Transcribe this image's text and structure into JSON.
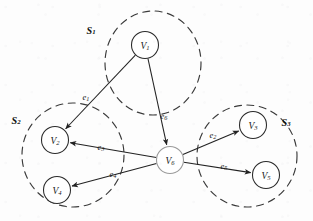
{
  "figure": {
    "kind": "graph-partition-diagram",
    "width": 313,
    "height": 221,
    "background_color": "#fdfdfd",
    "ink_color": "#222222",
    "hub_stroke_color": "#9a9a9a"
  },
  "nodes": [
    {
      "id": "v1",
      "base": "V",
      "sub": "1",
      "cx": 145,
      "cy": 45,
      "r": 13.5,
      "hub": false
    },
    {
      "id": "v2",
      "base": "V",
      "sub": "2",
      "cx": 55,
      "cy": 140,
      "r": 13.5,
      "hub": false
    },
    {
      "id": "v3",
      "base": "V",
      "sub": "3",
      "cx": 253,
      "cy": 125,
      "r": 13.5,
      "hub": false
    },
    {
      "id": "v4",
      "base": "V",
      "sub": "4",
      "cx": 57,
      "cy": 190,
      "r": 13.5,
      "hub": false
    },
    {
      "id": "v5",
      "base": "V",
      "sub": "5",
      "cx": 266,
      "cy": 175,
      "r": 13.5,
      "hub": false
    },
    {
      "id": "v6",
      "base": "V",
      "sub": "6",
      "cx": 170,
      "cy": 160,
      "r": 13.5,
      "hub": true
    }
  ],
  "edges": [
    {
      "id": "e1",
      "base": "e",
      "sub": "1",
      "from": "v1",
      "to": "v2",
      "label_x": 86,
      "label_y": 97
    },
    {
      "id": "e2",
      "base": "e",
      "sub": "2",
      "from": "v6",
      "to": "v3",
      "label_x": 213,
      "label_y": 135
    },
    {
      "id": "e3",
      "base": "e",
      "sub": "3",
      "from": "v6",
      "to": "v2",
      "label_x": 101,
      "label_y": 147
    },
    {
      "id": "e4",
      "base": "e",
      "sub": "4",
      "from": "v6",
      "to": "v4",
      "label_x": 113,
      "label_y": 174
    },
    {
      "id": "e5",
      "base": "e",
      "sub": "5",
      "from": "v6",
      "to": "v5",
      "label_x": 224,
      "label_y": 166
    },
    {
      "id": "e6",
      "base": "e",
      "sub": "6",
      "from": "v1",
      "to": "v6",
      "label_x": 164,
      "label_y": 116
    }
  ],
  "clusters": [
    {
      "id": "s1",
      "base": "S",
      "sub": "1",
      "cx": 153,
      "cy": 63,
      "rx": 48,
      "ry": 52,
      "label_x": 91,
      "label_y": 30,
      "members": [
        "v1"
      ]
    },
    {
      "id": "s2",
      "base": "S",
      "sub": "2",
      "cx": 73,
      "cy": 155,
      "rx": 51,
      "ry": 52,
      "label_x": 16,
      "label_y": 120,
      "members": [
        "v2",
        "v4"
      ]
    },
    {
      "id": "s3",
      "base": "S",
      "sub": "3",
      "cx": 247,
      "cy": 156,
      "rx": 50,
      "ry": 51,
      "label_x": 286,
      "label_y": 122,
      "members": [
        "v3",
        "v5"
      ]
    }
  ]
}
